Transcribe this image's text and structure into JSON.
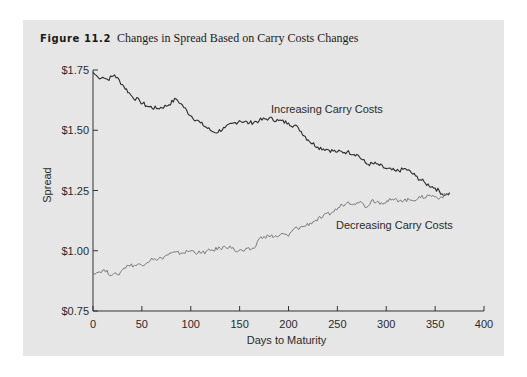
{
  "figure": {
    "label": "Figure 11.2",
    "caption": "Changes in Spread Based on Carry Costs Changes"
  },
  "colors": {
    "panel_background": "#e6e6e6",
    "axis": "#333333",
    "increasing_line": "#2b2b2b",
    "decreasing_line": "#7a7a7a"
  },
  "chart_data": {
    "type": "line",
    "title": "Changes in Spread Based on Carry Costs Changes",
    "xlabel": "Days to Maturity",
    "ylabel": "Spread",
    "xlim": [
      0,
      400
    ],
    "ylim": [
      0.75,
      1.75
    ],
    "xticks": [
      0,
      50,
      100,
      150,
      200,
      250,
      300,
      350,
      400
    ],
    "xtick_labels": [
      "0",
      "50",
      "100",
      "150",
      "200",
      "250",
      "300",
      "350",
      "400"
    ],
    "yticks": [
      0.75,
      1.0,
      1.25,
      1.5,
      1.75
    ],
    "ytick_labels": [
      "$0.75",
      "$1.00",
      "$1.25",
      "$1.50",
      "$1.75"
    ],
    "grid": false,
    "legend": "none (inline series labels)",
    "series": [
      {
        "name": "Increasing Carry Costs",
        "x": [
          0,
          5,
          10,
          15,
          22,
          30,
          40,
          48,
          55,
          65,
          75,
          85,
          90,
          100,
          110,
          120,
          125,
          135,
          150,
          160,
          170,
          180,
          190,
          200,
          210,
          220,
          230,
          240,
          250,
          260,
          270,
          280,
          290,
          300,
          310,
          320,
          330,
          340,
          350,
          360,
          365
        ],
        "y": [
          1.74,
          1.72,
          1.72,
          1.71,
          1.73,
          1.69,
          1.64,
          1.62,
          1.6,
          1.59,
          1.6,
          1.63,
          1.61,
          1.56,
          1.53,
          1.5,
          1.49,
          1.51,
          1.54,
          1.53,
          1.54,
          1.55,
          1.54,
          1.53,
          1.51,
          1.46,
          1.43,
          1.42,
          1.41,
          1.41,
          1.4,
          1.36,
          1.36,
          1.34,
          1.33,
          1.34,
          1.31,
          1.28,
          1.26,
          1.23,
          1.24
        ]
      },
      {
        "name": "Decreasing Carry Costs",
        "x": [
          0,
          5,
          10,
          20,
          25,
          30,
          35,
          45,
          55,
          60,
          65,
          70,
          80,
          90,
          100,
          110,
          120,
          130,
          140,
          145,
          155,
          165,
          170,
          175,
          180,
          190,
          195,
          200,
          205,
          215,
          225,
          235,
          245,
          255,
          260,
          270,
          275,
          280,
          285,
          295,
          305,
          315,
          325,
          335,
          345,
          355,
          365
        ],
        "y": [
          0.91,
          0.91,
          0.92,
          0.9,
          0.9,
          0.92,
          0.94,
          0.94,
          0.95,
          0.97,
          0.96,
          0.97,
          0.99,
          0.99,
          1.0,
          0.99,
          1.0,
          1.01,
          1.02,
          1.0,
          1.0,
          1.01,
          1.05,
          1.06,
          1.06,
          1.06,
          1.07,
          1.06,
          1.09,
          1.1,
          1.12,
          1.14,
          1.16,
          1.19,
          1.2,
          1.2,
          1.2,
          1.18,
          1.21,
          1.2,
          1.21,
          1.21,
          1.21,
          1.22,
          1.23,
          1.22,
          1.24
        ]
      }
    ],
    "annotations": [
      "Increasing Carry Costs",
      "Decreasing Carry Costs"
    ]
  }
}
